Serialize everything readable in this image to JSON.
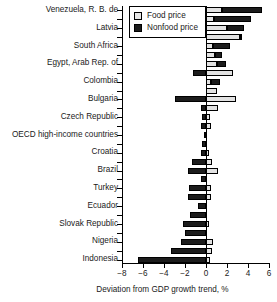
{
  "chart_data": {
    "type": "bar",
    "orientation": "horizontal",
    "stacked": true,
    "title": "",
    "xlabel": "Deviation from GDP growth trend, %",
    "ylabel": "",
    "xlim": [
      -8,
      6
    ],
    "xticks": [
      -8,
      -6,
      -4,
      -2,
      0,
      2,
      4,
      6
    ],
    "xticklabels": [
      "−8",
      "−6",
      "−4",
      "−2",
      "0",
      "2",
      "4",
      "6"
    ],
    "grid": false,
    "legend_position": "upper-left-inside",
    "legend": [
      {
        "name": "Food price",
        "color": "#e8e8e8"
      },
      {
        "name": "Nonfood price",
        "color": "#1c1c1c"
      }
    ],
    "series": [
      {
        "name": "Food price",
        "color": "#e8e8e8"
      },
      {
        "name": "Nonfood price",
        "color": "#1c1c1c"
      }
    ],
    "categories": [
      "Venezuela, R. B. de",
      "",
      "Latvia",
      "",
      "South Africa",
      "",
      "Egypt, Arab Rep. of",
      "",
      "Colombia",
      "",
      "Bulgaria",
      "",
      "Czech Republic",
      "",
      "OECD high-income countries",
      "",
      "Croatia",
      "",
      "Brazil",
      "",
      "Turkey",
      "",
      "Ecuador",
      "",
      "Slovak Republic",
      "",
      "Nigeria",
      "",
      "Indonesia"
    ],
    "visible_labels": [
      "Venezuela, R. B. de",
      "Latvia",
      "South Africa",
      "Egypt, Arab Rep. of",
      "Colombia",
      "Bulgaria",
      "Czech Republic",
      "OECD high-income countries",
      "Croatia",
      "Brazil",
      "Turkey",
      "Ecuador",
      "Slovak Republic",
      "Nigeria",
      "Indonesia"
    ],
    "bars": [
      {
        "row": 0,
        "food": 1.5,
        "nonfood": 3.8
      },
      {
        "row": 1,
        "food": 0.8,
        "nonfood": 3.5
      },
      {
        "row": 2,
        "food": 2.0,
        "nonfood": 1.6
      },
      {
        "row": 3,
        "food": 3.2,
        "nonfood": 0.1
      },
      {
        "row": 4,
        "food": 0.7,
        "nonfood": 1.6
      },
      {
        "row": 5,
        "food": 0.9,
        "nonfood": 0.6
      },
      {
        "row": 6,
        "food": 1.0,
        "nonfood": 0.9
      },
      {
        "row": 7,
        "food": 2.6,
        "nonfood": -1.2
      },
      {
        "row": 8,
        "food": 0.5,
        "nonfood": 0.8
      },
      {
        "row": 9,
        "food": 1.0,
        "nonfood": 0.0
      },
      {
        "row": 10,
        "food": 2.9,
        "nonfood": -3.0
      },
      {
        "row": 11,
        "food": 1.1,
        "nonfood": -0.5
      },
      {
        "row": 12,
        "food": 0.4,
        "nonfood": -0.4
      },
      {
        "row": 13,
        "food": 0.5,
        "nonfood": -0.5
      },
      {
        "row": 14,
        "food": 0.0,
        "nonfood": -0.2
      },
      {
        "row": 15,
        "food": 0.0,
        "nonfood": -0.4
      },
      {
        "row": 16,
        "food": 0.3,
        "nonfood": -0.5
      },
      {
        "row": 17,
        "food": 0.6,
        "nonfood": -1.3
      },
      {
        "row": 18,
        "food": 1.1,
        "nonfood": -1.7
      },
      {
        "row": 19,
        "food": 0.0,
        "nonfood": -0.5
      },
      {
        "row": 20,
        "food": 0.5,
        "nonfood": -1.6
      },
      {
        "row": 21,
        "food": 0.5,
        "nonfood": -1.7
      },
      {
        "row": 22,
        "food": 0.0,
        "nonfood": -0.8
      },
      {
        "row": 23,
        "food": 0.0,
        "nonfood": -1.5
      },
      {
        "row": 24,
        "food": 0.3,
        "nonfood": -2.2
      },
      {
        "row": 25,
        "food": 0.0,
        "nonfood": -2.0
      },
      {
        "row": 26,
        "food": 0.7,
        "nonfood": -2.4
      },
      {
        "row": 27,
        "food": 0.6,
        "nonfood": -3.3
      },
      {
        "row": 28,
        "food": 0.4,
        "nonfood": -6.5
      }
    ]
  }
}
